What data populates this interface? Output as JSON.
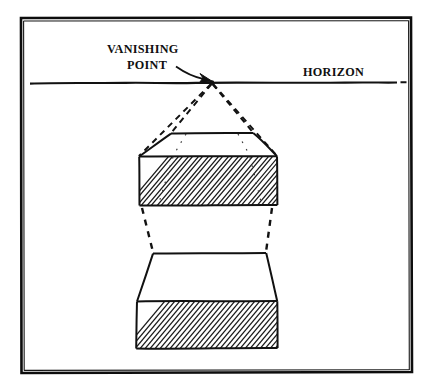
{
  "figure": {
    "title_alt": "One-point perspective diagram with vanishing point on horizon",
    "labels": {
      "vanishing_line1": "VANISHING",
      "vanishing_line2": "POINT",
      "horizon": "HORIZON"
    },
    "colors": {
      "ink": "#151515",
      "frame": "#0d0d0d",
      "paper": "#ffffff",
      "hatch": "#1a1a1a"
    },
    "geometry": {
      "frame": {
        "x": 20,
        "y": 17,
        "width": 392,
        "height": 356
      },
      "horizon_y": 82,
      "horizon_x_start": 30,
      "horizon_x_end": 405,
      "vanishing_point": {
        "x": 212,
        "y": 82
      },
      "upper_box": {
        "top_face": [
          [
            171,
            133
          ],
          [
            253,
            133
          ],
          [
            276,
            156
          ],
          [
            139,
            156
          ]
        ],
        "front_face": [
          [
            139,
            156
          ],
          [
            276,
            156
          ],
          [
            277,
            205
          ],
          [
            139,
            205
          ]
        ],
        "hatched": true
      },
      "lower_box": {
        "upper_face": [
          [
            153,
            253
          ],
          [
            266,
            253
          ],
          [
            277,
            301
          ],
          [
            137,
            301
          ]
        ],
        "front_face": [
          [
            137,
            301
          ],
          [
            277,
            301
          ],
          [
            277,
            348
          ],
          [
            136,
            348
          ]
        ],
        "hatched": true
      },
      "rays": [
        {
          "from": [
            212,
            82
          ],
          "to": [
            139,
            156
          ]
        },
        {
          "from": [
            212,
            82
          ],
          "to": [
            171,
            133
          ]
        },
        {
          "from": [
            212,
            82
          ],
          "to": [
            253,
            133
          ]
        },
        {
          "from": [
            212,
            82
          ],
          "to": [
            276,
            156
          ]
        }
      ],
      "connectors": [
        {
          "from": [
            142,
            207
          ],
          "to": [
            153,
            253
          ]
        },
        {
          "from": [
            272,
            207
          ],
          "to": [
            266,
            253
          ]
        }
      ]
    },
    "annotations": {
      "arrow_from": [
        178,
        68
      ],
      "arrow_to": [
        210,
        81
      ]
    }
  }
}
